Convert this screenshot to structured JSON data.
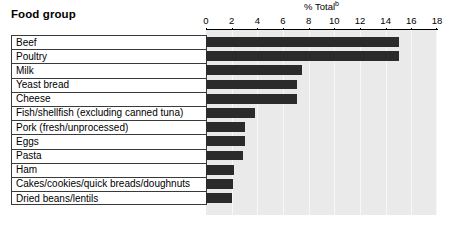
{
  "header": {
    "row_header": "Food group",
    "axis_title": "% Total",
    "axis_title_footnote": "b"
  },
  "chart_data": {
    "type": "bar",
    "orientation": "horizontal",
    "title": "",
    "subtitle": "",
    "xlabel": "% Total",
    "ylabel": "Food group",
    "xlim": [
      0,
      18
    ],
    "xticks": [
      0,
      2,
      4,
      6,
      8,
      10,
      12,
      14,
      16,
      18
    ],
    "xtick_labels": [
      "0",
      "2",
      "4",
      "6",
      "8",
      "10",
      "12",
      "14",
      "16",
      "18"
    ],
    "grid": true,
    "grid_axis": "x",
    "legend": false,
    "legend_position": "none",
    "bar_color": "#2b2b2b",
    "plot_background": "#eaeaea",
    "categories": [
      "Beef",
      "Poultry",
      "Milk",
      "Yeast bread",
      "Cheese",
      "Fish/shellfish (excluding canned tuna)",
      "Pork (fresh/unprocessed)",
      "Eggs",
      "Pasta",
      "Ham",
      "Cakes/cookies/quick breads/doughnuts",
      "Dried beans/lentils"
    ],
    "values": [
      15.0,
      15.0,
      7.5,
      7.1,
      7.1,
      3.8,
      3.0,
      3.0,
      2.9,
      2.2,
      2.1,
      2.0
    ]
  }
}
